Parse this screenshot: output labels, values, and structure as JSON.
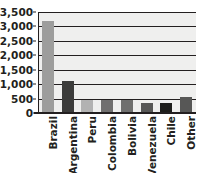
{
  "chart_data": {
    "type": "bar",
    "title": "",
    "xlabel": "",
    "ylabel": "",
    "categories": [
      "Brazil",
      "Argentina",
      "Peru",
      "Colombia",
      "Bolivia",
      "Venezuela",
      "Chile",
      "Other"
    ],
    "values": [
      3200,
      1100,
      460,
      450,
      440,
      340,
      330,
      550
    ],
    "bar_colors": [
      "#9d9d9c",
      "#3c3c3b",
      "#b2b2b2",
      "#706f6f",
      "#6f6f6e",
      "#575756",
      "#1d1d1b",
      "#575756"
    ],
    "ylim": [
      0,
      3500
    ],
    "ytick_values": [
      0,
      500,
      1000,
      1500,
      2000,
      2500,
      3000,
      3500
    ],
    "ytick_labels": [
      "0",
      "500",
      "1,000",
      "1,500",
      "2,000",
      "2,500",
      "3,000",
      "3,500"
    ],
    "grid": true,
    "grid_axis": "y",
    "legend": false,
    "plot_background": "#efefee",
    "axis_color": "#231f20"
  }
}
